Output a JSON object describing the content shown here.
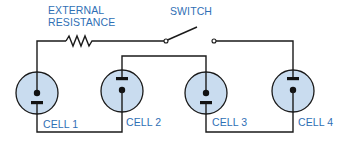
{
  "labels": {
    "external_resistance_line1": "EXTERNAL",
    "external_resistance_line2": "RESISTANCE",
    "switch": "SWITCH"
  },
  "cells": [
    {
      "label": "CELL 1",
      "plate_position": "bottom"
    },
    {
      "label": "CELL 2",
      "plate_position": "top"
    },
    {
      "label": "CELL 3",
      "plate_position": "bottom"
    },
    {
      "label": "CELL 4",
      "plate_position": "top"
    }
  ],
  "colors": {
    "label_text": "#2f6fb5",
    "cell_fill": "#c9dcef",
    "wire": "#1a1a1a"
  },
  "components": {
    "resistor": "zigzag-resistor-icon",
    "switch": "open-switch-icon"
  }
}
